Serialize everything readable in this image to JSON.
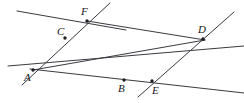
{
  "figure": {
    "width": 244,
    "height": 103,
    "background_color": "#ffffff",
    "line_color": "#3a3a40",
    "point_color": "#1d1d22",
    "label_color": "#16161a"
  },
  "points": [
    {
      "id": "A",
      "label": "A",
      "x": 33,
      "y": 70,
      "label_x": 24,
      "label_y": 72,
      "kind": "intersection"
    },
    {
      "id": "C",
      "label": "C",
      "x": 65,
      "y": 38,
      "label_x": 57,
      "label_y": 26,
      "kind": "marked"
    },
    {
      "id": "F",
      "label": "F",
      "x": 87,
      "y": 21,
      "label_x": 81,
      "label_y": 6,
      "kind": "intersection"
    },
    {
      "id": "B",
      "label": "B",
      "x": 124,
      "y": 80,
      "label_x": 118,
      "label_y": 83,
      "kind": "marked"
    },
    {
      "id": "E",
      "label": "E",
      "x": 152,
      "y": 81,
      "label_x": 152,
      "label_y": 85,
      "kind": "intersection"
    },
    {
      "id": "D",
      "label": "D",
      "x": 203,
      "y": 39,
      "label_x": 198,
      "label_y": 24,
      "kind": "intersection"
    }
  ],
  "lines": [
    {
      "id": "line-top",
      "name": "top-line-through-F",
      "x1": 17,
      "y1": 11,
      "x2": 126,
      "y2": 30
    },
    {
      "id": "line-A-F",
      "name": "line-A-C-F-extended",
      "x1": 110,
      "y1": 3,
      "x2": 22,
      "y2": 85
    },
    {
      "id": "line-through-A",
      "name": "horizontal-line-at-A",
      "x1": 8,
      "y1": 66,
      "x2": 244,
      "y2": 46
    },
    {
      "id": "line-A-B-E",
      "name": "line-A-B-E-extended",
      "x1": 30,
      "y1": 69,
      "x2": 244,
      "y2": 93
    },
    {
      "id": "line-E-D",
      "name": "line-E-D-extended",
      "x1": 138,
      "y1": 97,
      "x2": 234,
      "y2": 12
    },
    {
      "id": "line-A-D",
      "name": "diagonal-A-to-D",
      "x1": 33,
      "y1": 70,
      "x2": 205,
      "y2": 40
    },
    {
      "id": "line-F-D",
      "name": "segment-F-to-D",
      "x1": 87,
      "y1": 21,
      "x2": 205,
      "y2": 40
    }
  ]
}
